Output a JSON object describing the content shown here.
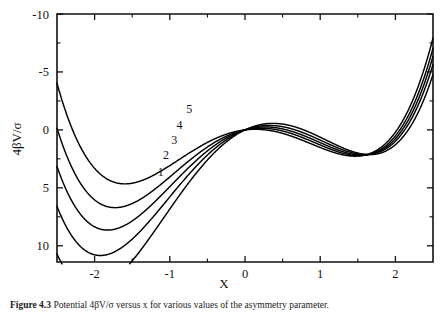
{
  "figure": {
    "caption_label": "Figure 4.3",
    "caption_text": "Potential 4βV/σ versus x for various values of the asymmetry parameter.",
    "background_color": "#ffffff",
    "curve_color": "#000000",
    "axis_color": "#111111"
  },
  "axes": {
    "x_title": "X",
    "y_title": "4βV/σ",
    "x_ticks": [
      "-2",
      "-1",
      "0",
      "1",
      "2"
    ],
    "y_ticks": [
      "10",
      "5",
      "0",
      "-5",
      "-10"
    ]
  },
  "chart_data": {
    "type": "line",
    "title": "",
    "subtitle": "",
    "xlabel": "X",
    "ylabel": "4βV/σ",
    "xlim": [
      -2.5,
      2.5
    ],
    "ylim": [
      -11.4,
      10.0
    ],
    "xticks": [
      -2,
      -1,
      0,
      1,
      2
    ],
    "yticks": [
      -10,
      -5,
      0,
      5,
      10
    ],
    "xticks_minor": [
      -2.5,
      -1.5,
      -0.5,
      0.5,
      1.5,
      2.5
    ],
    "yticks_minor": [
      -7.5,
      -2.5,
      2.5,
      7.5
    ],
    "grid": false,
    "legend": "inline-curve-labels",
    "legend_position": "on-curve-left-branch",
    "annotations": [
      {
        "text": "5",
        "x": -0.74,
        "y": 1.78
      },
      {
        "text": "4",
        "x": -0.87,
        "y": 0.4
      },
      {
        "text": "3",
        "x": -0.94,
        "y": -0.9
      },
      {
        "text": "2",
        "x": -1.05,
        "y": -2.2
      },
      {
        "text": "1",
        "x": -1.12,
        "y": -3.62
      }
    ],
    "series": [
      {
        "name": "1",
        "label": "1",
        "left_minimum": {
          "x": -1.33,
          "y": -4.0
        },
        "right_minimum": {
          "x": 1.63,
          "y": -11.2
        },
        "common_point": {
          "x": 0.0,
          "y": 0.0
        },
        "x": [
          -2.5,
          -2.4,
          -2.3,
          -2.2,
          -2.1,
          -2.0,
          -1.9,
          -1.8,
          -1.7,
          -1.6,
          -1.5,
          -1.4,
          -1.33,
          -1.2,
          -1.1,
          -1.0,
          -0.9,
          -0.8,
          -0.7,
          -0.6,
          -0.5,
          -0.4,
          -0.3,
          -0.2,
          -0.1,
          0.0,
          0.1,
          0.2,
          0.3,
          0.4,
          0.5,
          0.6,
          0.7,
          0.8,
          0.9,
          1.0,
          1.1,
          1.2,
          1.3,
          1.4,
          1.5,
          1.63,
          1.75,
          1.85,
          1.95,
          2.05,
          2.15,
          2.25,
          2.35,
          2.45,
          2.5
        ],
        "y": [
          23.44,
          17.66,
          12.63,
          8.28,
          4.55,
          1.39,
          -1.25,
          -3.4,
          -5.1,
          -6.39,
          -7.31,
          -7.88,
          -8.06,
          -8.02,
          -7.73,
          -7.25,
          -6.62,
          -5.86,
          -5.0,
          -4.08,
          -3.13,
          -2.18,
          -1.25,
          -0.39,
          0.39,
          1.05,
          1.56,
          1.89,
          2.02,
          1.92,
          1.56,
          0.92,
          -0.03,
          -1.32,
          -2.99,
          -5.06,
          -7.57,
          -10.55,
          -14.03,
          -18.05,
          -22.63,
          -29.18,
          -35.52,
          -41.42,
          -47.77,
          -54.59,
          -61.9,
          -69.72,
          -78.08,
          -86.99,
          -91.64
        ]
      },
      {
        "name": "2",
        "label": "2",
        "left_minimum": {
          "x": -1.27,
          "y": -2.6
        },
        "right_minimum": {
          "x": 1.58,
          "y": -8.5
        },
        "common_point": {
          "x": 0.0,
          "y": 0.0
        },
        "x": [
          -2.5,
          -2.4,
          -2.3,
          -2.2,
          -2.1,
          -2.0,
          -1.9,
          -1.8,
          -1.7,
          -1.6,
          -1.5,
          -1.4,
          -1.27,
          -1.2,
          -1.1,
          -1.0,
          -0.9,
          -0.8,
          -0.7,
          -0.6,
          -0.5,
          -0.4,
          -0.3,
          -0.2,
          -0.1,
          0.0,
          0.1,
          0.2,
          0.3,
          0.4,
          0.5,
          0.6,
          0.7,
          0.8,
          0.9,
          1.0,
          1.1,
          1.2,
          1.3,
          1.4,
          1.58,
          1.7,
          1.85,
          1.95,
          2.05,
          2.15,
          2.25,
          2.35,
          2.45,
          2.5
        ],
        "y": [
          23.44,
          17.66,
          12.63,
          8.28,
          4.55,
          1.39,
          -1.25,
          -3.4,
          -5.1,
          -6.39,
          -7.31,
          -7.88,
          -8.06,
          -8.02,
          -7.73,
          -7.25,
          -6.62,
          -5.86,
          -5.0,
          -4.08,
          -3.13,
          -2.18,
          -1.25,
          -0.39,
          0.39,
          1.05,
          1.56,
          1.89,
          2.02,
          1.92,
          1.56,
          0.92,
          -0.03,
          -1.32,
          -2.99,
          -5.06,
          -7.57,
          -10.55,
          -14.03,
          -18.05,
          -26.0,
          -32.2,
          -40.3,
          -46.1,
          -52.5,
          -59.4,
          -67.0,
          -75.2,
          -84.0,
          -88.6
        ]
      },
      {
        "name": "3",
        "label": "3",
        "left_minimum": {
          "x": -1.22,
          "y": -1.4
        },
        "right_minimum": {
          "x": 1.54,
          "y": -7.2
        },
        "common_point": {
          "x": 0.0,
          "y": 0.0
        }
      },
      {
        "name": "4",
        "label": "4",
        "left_minimum": {
          "x": -1.15,
          "y": -0.3
        },
        "right_minimum": {
          "x": 1.5,
          "y": -5.8
        },
        "common_point": {
          "x": 0.0,
          "y": 0.0
        }
      },
      {
        "name": "5",
        "label": "5",
        "left_minimum": {
          "x": -1.0,
          "y": 1.3
        },
        "right_minimum": {
          "x": 1.45,
          "y": -4.2
        },
        "common_point": {
          "x": 0.0,
          "y": 0.0
        }
      }
    ],
    "curve_shape_params": [
      {
        "name": "1",
        "a": 4.35,
        "b": 3.1,
        "c": 0.62
      },
      {
        "name": "2",
        "a": 3.95,
        "b": 2.45,
        "c": 0.62
      },
      {
        "name": "3",
        "a": 3.62,
        "b": 1.9,
        "c": 0.62
      },
      {
        "name": "4",
        "a": 3.3,
        "b": 1.38,
        "c": 0.62
      },
      {
        "name": "5",
        "a": 2.92,
        "b": 0.78,
        "c": 0.62
      }
    ]
  }
}
